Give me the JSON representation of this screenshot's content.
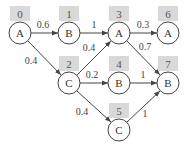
{
  "diagram": {
    "type": "weighted-directed-graph",
    "nodes": [
      {
        "id": "0",
        "label": "A",
        "x": 20,
        "y": 33
      },
      {
        "id": "1",
        "label": "B",
        "x": 69,
        "y": 33
      },
      {
        "id": "2",
        "label": "C",
        "x": 69,
        "y": 83
      },
      {
        "id": "3",
        "label": "A",
        "x": 119,
        "y": 33
      },
      {
        "id": "4",
        "label": "B",
        "x": 119,
        "y": 83
      },
      {
        "id": "5",
        "label": "C",
        "x": 119,
        "y": 130
      },
      {
        "id": "6",
        "label": "A",
        "x": 168,
        "y": 33
      },
      {
        "id": "7",
        "label": "B",
        "x": 168,
        "y": 83
      }
    ],
    "edges": [
      {
        "from": "0",
        "to": "1",
        "weight": "0.6"
      },
      {
        "from": "0",
        "to": "2",
        "weight": "0.4"
      },
      {
        "from": "1",
        "to": "3",
        "weight": "1"
      },
      {
        "from": "2",
        "to": "3",
        "weight": "0.4"
      },
      {
        "from": "2",
        "to": "4",
        "weight": "0.2"
      },
      {
        "from": "2",
        "to": "5",
        "weight": "0.4"
      },
      {
        "from": "3",
        "to": "6",
        "weight": "0.3"
      },
      {
        "from": "3",
        "to": "7",
        "weight": "0.7"
      },
      {
        "from": "4",
        "to": "7",
        "weight": "1"
      },
      {
        "from": "5",
        "to": "7",
        "weight": "1"
      }
    ]
  }
}
